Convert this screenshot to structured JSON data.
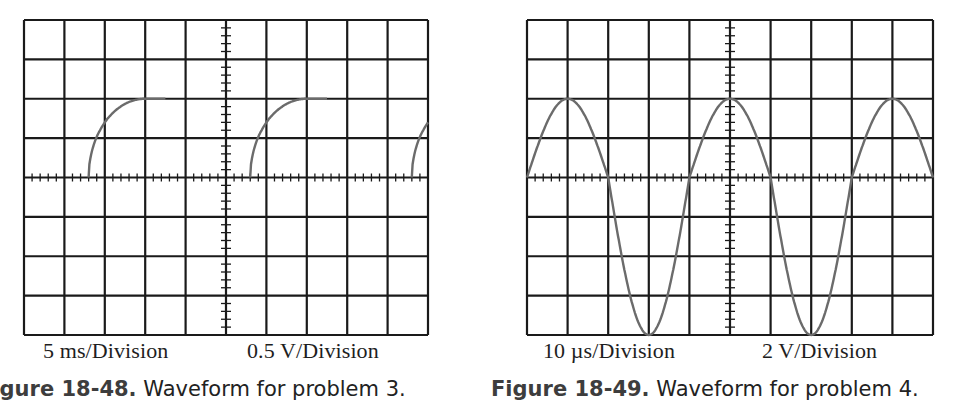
{
  "figures": [
    {
      "id": "left",
      "caption_number": "Figure 18-48.",
      "caption_text": " Waveform for problem 3.",
      "time_scale": "5 ms/Division",
      "volt_scale": "0.5 V/Division",
      "grid": {
        "x": 24,
        "y": 20,
        "width": 404,
        "height": 315,
        "cols": 10,
        "rows": 8
      }
    },
    {
      "id": "right",
      "caption_number": "Figure 18-49.",
      "caption_text": " Waveform for problem 4.",
      "time_scale": "10 µs/Division",
      "volt_scale": "2 V/Division",
      "grid": {
        "x": 527,
        "y": 20,
        "width": 406,
        "height": 315,
        "cols": 10,
        "rows": 8
      }
    }
  ],
  "colors": {
    "grid": "#1a1a1a",
    "trace": "#6b6b6b",
    "background": "#ffffff"
  },
  "chart_data": [
    {
      "type": "line",
      "title": "Figure 18-48. Waveform for problem 3.",
      "xlabel": "5 ms/Division",
      "ylabel": "0.5 V/Division",
      "grid": true,
      "x_divisions": 10,
      "y_divisions": 8,
      "description": "Repeating exponential (RC charging) rise from 0 V to +2 div (1.0 V), flat top, then absent; period 4 div (20 ms)",
      "series": [
        {
          "name": "trace-1",
          "x_div": [
            1.6,
            1.8,
            2.1,
            2.5,
            3.0,
            3.5
          ],
          "y_div": [
            0,
            0.9,
            1.4,
            1.75,
            2.0,
            2.0
          ]
        },
        {
          "name": "trace-2",
          "x_div": [
            5.6,
            5.8,
            6.1,
            6.5,
            7.0,
            7.5
          ],
          "y_div": [
            0,
            0.9,
            1.4,
            1.75,
            2.0,
            2.0
          ]
        },
        {
          "name": "trace-3",
          "x_div": [
            9.6,
            9.8,
            10.0
          ],
          "y_div": [
            0,
            0.9,
            1.35
          ]
        }
      ],
      "ylim_div": [
        -4,
        4
      ],
      "xlim_div": [
        0,
        10
      ],
      "peak_voltage": 1.0,
      "period_ms": 20
    },
    {
      "type": "line",
      "title": "Figure 18-49. Waveform for problem 4.",
      "xlabel": "10 µs/Division",
      "ylabel": "2 V/Division",
      "grid": true,
      "x_divisions": 10,
      "y_divisions": 8,
      "description": "Asymmetric sine-like wave: positive half peaks at +2 div (+4 V), negative half reaches -4 div (-8 V); period 4 div (40 µs)",
      "series": [
        {
          "name": "trace",
          "x_div": [
            0,
            1,
            2,
            3,
            4,
            5,
            6,
            7,
            8,
            9,
            10
          ],
          "y_div": [
            0,
            2,
            0,
            -4,
            0,
            2,
            0,
            -4,
            0,
            2,
            0
          ]
        }
      ],
      "ylim_div": [
        -4,
        4
      ],
      "xlim_div": [
        0,
        10
      ],
      "positive_peak_V": 4,
      "negative_peak_V": -8,
      "period_us": 40
    }
  ]
}
